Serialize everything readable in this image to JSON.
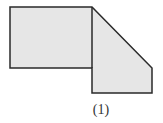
{
  "figure": {
    "label": "(1)",
    "fill_color": "#e6e6e6",
    "stroke_color": "#2a2a2a",
    "shape": {
      "description": "Composite polygon: a rectangle on the left joined to a trapezoid-like pentagon on the right with a diagonal top edge",
      "points": [
        [
          10,
          7
        ],
        [
          92,
          7
        ],
        [
          152,
          68
        ],
        [
          152,
          93
        ],
        [
          92,
          93
        ],
        [
          92,
          68
        ],
        [
          10,
          68
        ]
      ],
      "internal_edge": [
        [
          92,
          7
        ],
        [
          92,
          68
        ]
      ]
    }
  }
}
